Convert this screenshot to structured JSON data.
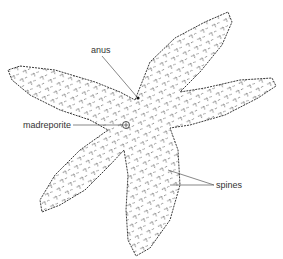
{
  "diagram": {
    "labels": {
      "anus": "anus",
      "madreporite": "madreporite",
      "spines": "spines"
    },
    "colors": {
      "outline": "#3a3a3a",
      "fill": "#ffffff",
      "leader_line": "#555555",
      "text": "#333333"
    }
  }
}
